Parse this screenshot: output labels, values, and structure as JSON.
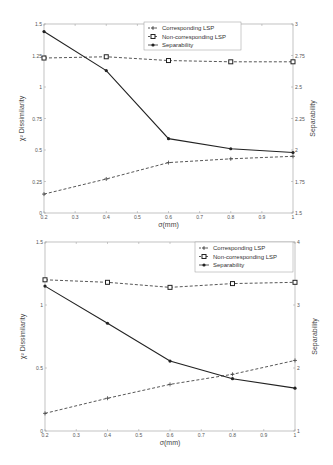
{
  "chart_data": [
    {
      "type": "line",
      "title": "",
      "xlabel": "σ(mm)",
      "ylabel": "χ² Dissimilarity",
      "y2label": "Separability",
      "x": [
        0.2,
        0.4,
        0.6,
        0.8,
        1.0
      ],
      "xticks": [
        "0.2",
        "0.3",
        "0.4",
        "0.5",
        "0.6",
        "0.7",
        "0.8",
        "0.9",
        "1"
      ],
      "ylim": [
        0,
        1.5
      ],
      "yticks": [
        "0",
        "0.25",
        "0.5",
        "0.75",
        "1",
        "1.25",
        "1.5"
      ],
      "y2lim": [
        1.5,
        3
      ],
      "y2ticks": [
        "1.5",
        "1.75",
        "2",
        "2.25",
        "2.5",
        "2.75",
        "3"
      ],
      "legend_position": "top-center",
      "series": [
        {
          "name": "Corresponding LSP",
          "axis": "left",
          "style": "dashed",
          "marker": "plus",
          "values": [
            0.15,
            0.27,
            0.4,
            0.43,
            0.45
          ]
        },
        {
          "name": "Non-corresponding LSP",
          "axis": "left",
          "style": "dashed",
          "marker": "square",
          "values": [
            1.23,
            1.24,
            1.21,
            1.2,
            1.2
          ]
        },
        {
          "name": "Separability",
          "axis": "right",
          "style": "solid",
          "marker": "dot",
          "values": [
            2.94,
            2.63,
            2.09,
            2.01,
            1.98
          ]
        }
      ]
    },
    {
      "type": "line",
      "title": "",
      "xlabel": "σ(mm)",
      "ylabel": "χ² Dissimilarity",
      "y2label": "Separability",
      "x": [
        0.2,
        0.4,
        0.6,
        0.8,
        1.0
      ],
      "xticks": [
        "0.2",
        "0.3",
        "0.4",
        "0.5",
        "0.6",
        "0.7",
        "0.8",
        "0.9",
        "1"
      ],
      "ylim": [
        0,
        1.5
      ],
      "yticks": [
        "0",
        "0.5",
        "1",
        "1.5"
      ],
      "y2lim": [
        1,
        4
      ],
      "y2ticks": [
        "1",
        "2",
        "3",
        "4"
      ],
      "legend_position": "top-right",
      "series": [
        {
          "name": "Corresponding LSP",
          "axis": "left",
          "style": "dashed",
          "marker": "plus",
          "values": [
            0.14,
            0.26,
            0.37,
            0.45,
            0.56
          ]
        },
        {
          "name": "Non-corresponding LSP",
          "axis": "left",
          "style": "dashed",
          "marker": "square",
          "values": [
            1.2,
            1.18,
            1.14,
            1.17,
            1.18
          ]
        },
        {
          "name": "Separability",
          "axis": "right",
          "style": "solid",
          "marker": "dot",
          "values": [
            3.3,
            2.71,
            2.11,
            1.83,
            1.68
          ]
        }
      ]
    }
  ],
  "layout": [
    {
      "box": {
        "x0": 44,
        "x1": 293,
        "y0": 24,
        "y1": 213
      },
      "legend": {
        "x": 144,
        "y": 22,
        "w": 97,
        "h": 28
      }
    },
    {
      "box": {
        "x0": 45,
        "x1": 295,
        "y0": 242,
        "y1": 431
      },
      "legend": {
        "x": 195,
        "y": 242,
        "w": 98,
        "h": 30
      }
    }
  ]
}
